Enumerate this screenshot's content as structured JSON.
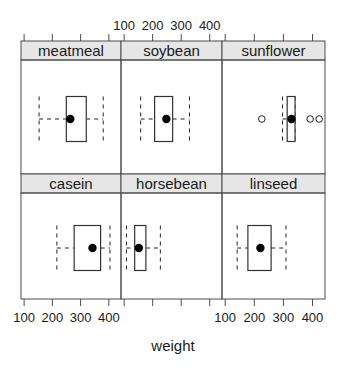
{
  "chart_data": {
    "type": "boxplot",
    "title": "",
    "xlabel": "weight",
    "ylabel": "",
    "xlim": [
      89,
      443
    ],
    "ticks": [
      100,
      200,
      300,
      400
    ],
    "tick_labels": [
      "100",
      "200",
      "300",
      "400"
    ],
    "layout": {
      "columns": 3,
      "rows": 2
    },
    "grid": false,
    "legend": null,
    "strip_color": "#e6e6e6",
    "panels": [
      {
        "name": "meatmeal",
        "row": 0,
        "col": 0,
        "whisker_low": 153,
        "q1": 249.5,
        "median": 263.5,
        "q3": 320,
        "whisker_high": 380,
        "outliers": []
      },
      {
        "name": "soybean",
        "row": 0,
        "col": 1,
        "whisker_low": 158,
        "q1": 206.8,
        "median": 248,
        "q3": 270,
        "whisker_high": 329,
        "outliers": []
      },
      {
        "name": "sunflower",
        "row": 0,
        "col": 2,
        "whisker_low": 297,
        "q1": 313,
        "median": 328,
        "q3": 340,
        "whisker_high": 340,
        "outliers": [
          226,
          392,
          423
        ]
      },
      {
        "name": "casein",
        "row": 1,
        "col": 0,
        "whisker_low": 216,
        "q1": 277.2,
        "median": 342,
        "q3": 370.8,
        "whisker_high": 404,
        "outliers": []
      },
      {
        "name": "horsebean",
        "row": 1,
        "col": 1,
        "whisker_low": 108,
        "q1": 137,
        "median": 151.5,
        "q3": 176.2,
        "whisker_high": 227,
        "outliers": []
      },
      {
        "name": "linseed",
        "row": 1,
        "col": 2,
        "whisker_low": 141,
        "q1": 178,
        "median": 221,
        "q3": 257.8,
        "whisker_high": 309,
        "outliers": []
      }
    ]
  },
  "axis": {
    "xlabel": "weight"
  }
}
